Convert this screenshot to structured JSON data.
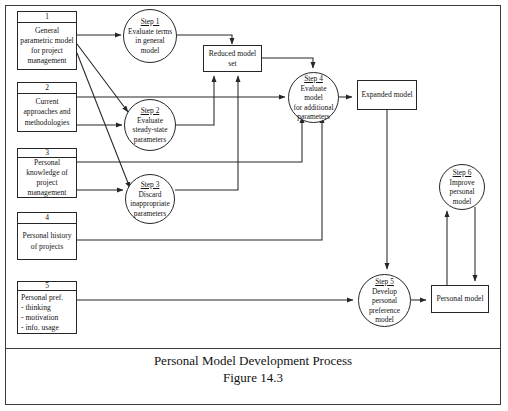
{
  "figure": {
    "caption_title": "Personal Model Development Process",
    "caption_number": "Figure 14.3"
  },
  "sources": [
    {
      "number": "1",
      "text": "General\nparametric model\nfor project\nmanagement"
    },
    {
      "number": "2",
      "text": "Current\napproaches and\nmethodologies"
    },
    {
      "number": "3",
      "text": "Personal\nknowledge of\nproject\nmanagement"
    },
    {
      "number": "4",
      "text": "Personal history\nof projects"
    },
    {
      "number": "5",
      "text": "Personal pref.\n- thinking\n- motivation\n- info. usage"
    }
  ],
  "processes": [
    {
      "title": "Step 1",
      "text": "Evaluate terms\nin general\nmodel"
    },
    {
      "title": "Step 2",
      "text": "Evaluate\nsteady-state\nparameters"
    },
    {
      "title": "Step 3",
      "text": "Discard\ninappropriate\nparameters"
    },
    {
      "title": "Step 4",
      "text": "Evaluate model\nfor additional\nparameters"
    },
    {
      "title": "Step 5",
      "text": "Develop\npersonal\npreference\nmodel"
    },
    {
      "title": "Step 6",
      "text": "Improve\npersonal model"
    }
  ],
  "stores": [
    {
      "label": "Reduced model\nset"
    },
    {
      "label": "Expanded model"
    },
    {
      "label": "Personal model"
    }
  ],
  "colors": {
    "line": "#262626",
    "frame": "#3a3a3a",
    "background": "#ffffff",
    "text": "#141414"
  }
}
